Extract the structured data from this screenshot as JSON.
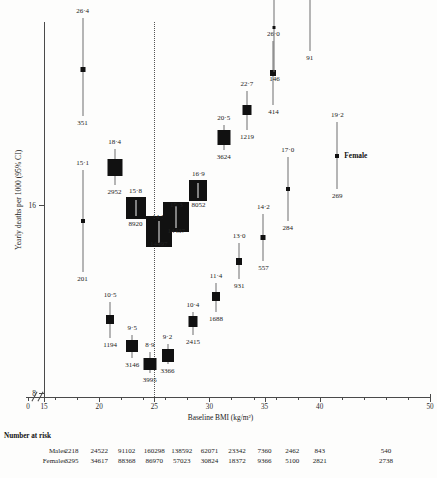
{
  "chart_data": {
    "type": "scatter",
    "title": "",
    "xlabel": "Baseline BMI (kg/m²)",
    "ylabel": "Yearly deaths per 1000 (95% CI)",
    "xlim": [
      15,
      50
    ],
    "xticks": [
      15,
      20,
      25,
      30,
      35,
      40,
      50
    ],
    "xtick_labels": [
      "15",
      "20",
      "25",
      "30",
      "35",
      "40",
      "50"
    ],
    "x_origin_label": "0",
    "axis_break": true,
    "yscale": "log",
    "yticks": [
      8,
      16
    ],
    "ytick_labels": [
      "8",
      "16"
    ],
    "grid": false,
    "reference_line_x": 25,
    "legend_position": "inline-right",
    "series": [
      {
        "name": "Males",
        "marker": "square-box",
        "points": [
          {
            "x": 18.5,
            "y": 26.4,
            "label": "26·4",
            "n": "351",
            "w": 5,
            "h": 5,
            "ci_lo": 22.2,
            "ci_hi": 31.9
          },
          {
            "x": 21.4,
            "y": 18.4,
            "label": "18·4",
            "n": "2952",
            "w": 15,
            "h": 17,
            "ci_lo": 17.2,
            "ci_hi": 19.7
          },
          {
            "x": 23.3,
            "y": 15.8,
            "label": "15·8",
            "n": "8920",
            "w": 20,
            "h": 22,
            "ci_lo": 15.3,
            "ci_hi": 16.4
          },
          {
            "x": 25.4,
            "y": 14.5,
            "label": "14·5",
            "n": "14497",
            "w": 26,
            "h": 31,
            "ci_lo": 14.2,
            "ci_hi": 14.9
          },
          {
            "x": 27.0,
            "y": 15.3,
            "label": "15·3",
            "n": "14437",
            "w": 26,
            "h": 30,
            "ci_lo": 14.9,
            "ci_hi": 15.6
          },
          {
            "x": 29.0,
            "y": 16.9,
            "label": "16·9",
            "n": "8052",
            "w": 18,
            "h": 21,
            "ci_lo": 16.4,
            "ci_hi": 17.5
          },
          {
            "x": 31.3,
            "y": 20.5,
            "label": "20·5",
            "n": "3624",
            "w": 13,
            "h": 15,
            "ci_lo": 19.6,
            "ci_hi": 21.5
          },
          {
            "x": 33.4,
            "y": 22.7,
            "label": "22·7",
            "n": "1219",
            "w": 9,
            "h": 10,
            "ci_lo": 21.1,
            "ci_hi": 24.4
          },
          {
            "x": 35.8,
            "y": 26.0,
            "label": "26·0",
            "n": "414",
            "w": 6,
            "h": 6,
            "ci_lo": 23.1,
            "ci_hi": 29.3
          }
        ]
      },
      {
        "name": "Females",
        "marker": "square-box",
        "points": [
          {
            "x": 18.5,
            "y": 15.1,
            "label": "15·1",
            "n": "201",
            "w": 4,
            "h": 4,
            "ci_lo": 12.5,
            "ci_hi": 18.2
          },
          {
            "x": 21.0,
            "y": 10.5,
            "label": "10·5",
            "n": "1194",
            "w": 8,
            "h": 9,
            "ci_lo": 9.8,
            "ci_hi": 11.2
          },
          {
            "x": 23.0,
            "y": 9.5,
            "label": "9·5",
            "n": "3146",
            "w": 12,
            "h": 12,
            "ci_lo": 9.1,
            "ci_hi": 9.9
          },
          {
            "x": 24.6,
            "y": 8.9,
            "label": "8·9",
            "n": "3995",
            "w": 13,
            "h": 12,
            "ci_lo": 8.6,
            "ci_hi": 9.3
          },
          {
            "x": 26.2,
            "y": 9.2,
            "label": "9·2",
            "n": "3366",
            "w": 12,
            "h": 13,
            "ci_lo": 8.9,
            "ci_hi": 9.6
          },
          {
            "x": 28.5,
            "y": 10.4,
            "label": "10·4",
            "n": "2415",
            "w": 9,
            "h": 11,
            "ci_lo": 9.9,
            "ci_hi": 10.8
          },
          {
            "x": 30.6,
            "y": 11.4,
            "label": "11·4",
            "n": "1688",
            "w": 8,
            "h": 9,
            "ci_lo": 10.8,
            "ci_hi": 12.0
          },
          {
            "x": 32.7,
            "y": 13.0,
            "label": "13·0",
            "n": "931",
            "w": 6,
            "h": 7,
            "ci_lo": 12.2,
            "ci_hi": 13.9
          },
          {
            "x": 34.9,
            "y": 14.2,
            "label": "14·2",
            "n": "557",
            "w": 5,
            "h": 5,
            "ci_lo": 13.0,
            "ci_hi": 15.5
          },
          {
            "x": 37.1,
            "y": 17.0,
            "label": "17·0",
            "n": "284",
            "w": 4,
            "h": 4,
            "ci_lo": 15.1,
            "ci_hi": 19.1
          },
          {
            "x": 35.9,
            "y": 30.8,
            "label": "",
            "n": "146",
            "w": 3,
            "h": 3,
            "ci_lo": 26.1,
            "ci_hi": 36.3
          },
          {
            "x": 39.1,
            "y": 34.5,
            "label": "",
            "n": "91",
            "w": 0,
            "h": 0,
            "ci_lo": 28.2,
            "ci_hi": 42.0
          },
          {
            "x": 41.6,
            "y": 19.2,
            "label": "19·2",
            "n": "269",
            "w": 4,
            "h": 4,
            "ci_lo": 17.0,
            "ci_hi": 21.7,
            "series_tag": "Female"
          }
        ]
      }
    ],
    "inline_series_label": "Female",
    "number_at_risk": {
      "title": "Number at risk",
      "rows": [
        {
          "label": "Males",
          "values": [
            "2218",
            "24522",
            "91102",
            "160298",
            "138592",
            "62071",
            "23342",
            "7360",
            "2462",
            "843",
            "540"
          ]
        },
        {
          "label": "Females",
          "values": [
            "3295",
            "34617",
            "88368",
            "86970",
            "57023",
            "30824",
            "18372",
            "9366",
            "5100",
            "2821",
            "2738"
          ]
        }
      ],
      "column_x": [
        17.5,
        20,
        22.5,
        25,
        27.5,
        30,
        32.5,
        35,
        37.5,
        40,
        46
      ]
    }
  }
}
